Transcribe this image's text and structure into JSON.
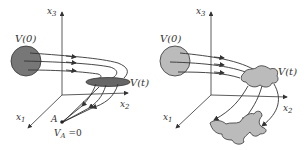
{
  "colors": {
    "stroke": "#333333",
    "sphere_fill": "#777777",
    "disk_fill": "#666666",
    "blob_fill": "#bbbbbb",
    "background": "#ffffff"
  },
  "left_panel": {
    "axis_x3": {
      "base": "x",
      "sub": "3"
    },
    "axis_x2": {
      "base": "x",
      "sub": "2"
    },
    "axis_x1": {
      "base": "x",
      "sub": "1"
    },
    "initial_volume": "V(0)",
    "final_volume": "V(t)",
    "point_label": "A",
    "point_volume": {
      "base": "V",
      "sub": "A",
      "rest": " =0"
    }
  },
  "right_panel": {
    "axis_x3": {
      "base": "x",
      "sub": "3"
    },
    "axis_x2": {
      "base": "x",
      "sub": "2"
    },
    "axis_x1": {
      "base": "x",
      "sub": "1"
    },
    "initial_volume": "V(0)",
    "final_volume": "V(t)"
  }
}
